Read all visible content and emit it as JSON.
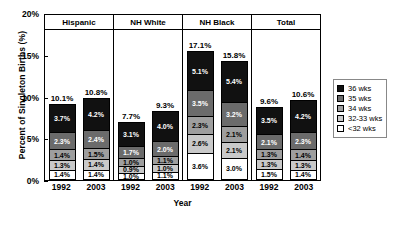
{
  "chart_data": {
    "type": "bar",
    "subtype": "stacked-bar-grouped",
    "title": "",
    "xlabel": "Year",
    "ylabel": "Percent of Singleton Births (%)",
    "ylim": [
      0,
      20
    ],
    "yticks": [
      "0%",
      "5%",
      "10%",
      "15%",
      "20%"
    ],
    "ytick_values": [
      0,
      5,
      10,
      15,
      20
    ],
    "grid": false,
    "legend_position": "right",
    "group_labels": [
      "Hispanic",
      "NH White",
      "NH Black",
      "Total"
    ],
    "categories": [
      "1992",
      "2003",
      "1992",
      "2003",
      "1992",
      "2003",
      "1992",
      "2003"
    ],
    "series": [
      {
        "name": "36 wks",
        "color": "#111111",
        "values": [
          3.7,
          4.2,
          3.1,
          4.0,
          5.1,
          5.4,
          3.5,
          4.2
        ]
      },
      {
        "name": "35 wks",
        "color": "#6b6b6b",
        "values": [
          2.3,
          2.4,
          1.7,
          2.0,
          3.5,
          3.2,
          2.1,
          2.3
        ]
      },
      {
        "name": "34 wks",
        "color": "#9e9e9e",
        "values": [
          1.4,
          1.5,
          1.0,
          1.1,
          2.3,
          2.1,
          1.3,
          1.4
        ]
      },
      {
        "name": "32-33 wks",
        "color": "#c9c9c9",
        "values": [
          1.3,
          1.4,
          0.9,
          1.0,
          2.6,
          2.1,
          1.3,
          1.3
        ]
      },
      {
        "name": "<32 wks",
        "color": "#ffffff",
        "values": [
          1.4,
          1.4,
          1.0,
          1.1,
          3.6,
          3.0,
          1.5,
          1.4
        ]
      }
    ],
    "totals": [
      10.1,
      10.8,
      7.7,
      9.3,
      17.1,
      15.8,
      9.6,
      10.6
    ],
    "groups": [
      {
        "label": "Hispanic",
        "bars": [
          {
            "year": "1992",
            "total": "10.1%",
            "segments": [
              {
                "label": "3.7%",
                "value": 3.7
              },
              {
                "label": "2.3%",
                "value": 2.3
              },
              {
                "label": "1.4%",
                "value": 1.4
              },
              {
                "label": "1.3%",
                "value": 1.3
              },
              {
                "label": "1.4%",
                "value": 1.4
              }
            ]
          },
          {
            "year": "2003",
            "total": "10.8%",
            "segments": [
              {
                "label": "4.2%",
                "value": 4.2
              },
              {
                "label": "2.4%",
                "value": 2.4
              },
              {
                "label": "1.5%",
                "value": 1.5
              },
              {
                "label": "1.4%",
                "value": 1.4
              },
              {
                "label": "1.4%",
                "value": 1.4
              }
            ]
          }
        ]
      },
      {
        "label": "NH White",
        "bars": [
          {
            "year": "1992",
            "total": "7.7%",
            "segments": [
              {
                "label": "3.1%",
                "value": 3.1
              },
              {
                "label": "1.7%",
                "value": 1.7
              },
              {
                "label": "1.0%",
                "value": 1.0
              },
              {
                "label": "0.9%",
                "value": 0.9
              },
              {
                "label": "1.0%",
                "value": 1.0
              }
            ]
          },
          {
            "year": "2003",
            "total": "9.3%",
            "segments": [
              {
                "label": "4.0%",
                "value": 4.0
              },
              {
                "label": "2.0%",
                "value": 2.0
              },
              {
                "label": "1.1%",
                "value": 1.1
              },
              {
                "label": "1.0%",
                "value": 1.0
              },
              {
                "label": "1.1%",
                "value": 1.1
              }
            ]
          }
        ]
      },
      {
        "label": "NH Black",
        "bars": [
          {
            "year": "1992",
            "total": "17.1%",
            "segments": [
              {
                "label": "5.1%",
                "value": 5.1
              },
              {
                "label": "3.5%",
                "value": 3.5
              },
              {
                "label": "2.3%",
                "value": 2.3
              },
              {
                "label": "2.6%",
                "value": 2.6
              },
              {
                "label": "3.6%",
                "value": 3.6
              }
            ]
          },
          {
            "year": "2003",
            "total": "15.8%",
            "segments": [
              {
                "label": "5.4%",
                "value": 5.4
              },
              {
                "label": "3.2%",
                "value": 3.2
              },
              {
                "label": "2.1%",
                "value": 2.1
              },
              {
                "label": "2.1%",
                "value": 2.1
              },
              {
                "label": "3.0%",
                "value": 3.0
              }
            ]
          }
        ]
      },
      {
        "label": "Total",
        "bars": [
          {
            "year": "1992",
            "total": "9.6%",
            "segments": [
              {
                "label": "3.5%",
                "value": 3.5
              },
              {
                "label": "2.1%",
                "value": 2.1
              },
              {
                "label": "1.3%",
                "value": 1.3
              },
              {
                "label": "1.3%",
                "value": 1.3
              },
              {
                "label": "1.5%",
                "value": 1.5
              }
            ]
          },
          {
            "year": "2003",
            "total": "10.6%",
            "segments": [
              {
                "label": "4.2%",
                "value": 4.2
              },
              {
                "label": "2.3%",
                "value": 2.3
              },
              {
                "label": "1.4%",
                "value": 1.4
              },
              {
                "label": "1.3%",
                "value": 1.3
              },
              {
                "label": "1.4%",
                "value": 1.4
              }
            ]
          }
        ]
      }
    ],
    "legend": [
      {
        "label": "36 wks",
        "color": "#111111"
      },
      {
        "label": "35 wks",
        "color": "#6b6b6b"
      },
      {
        "label": "34 wks",
        "color": "#9e9e9e"
      },
      {
        "label": "32-33 wks",
        "color": "#c9c9c9"
      },
      {
        "label": "<32 wks",
        "color": "#ffffff"
      }
    ]
  }
}
